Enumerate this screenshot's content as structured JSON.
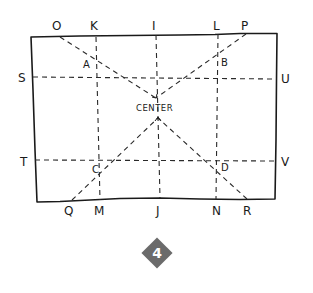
{
  "diagram": {
    "type": "hand-drawn rectangle construction with center lines and diagonals",
    "labels": {
      "top": [
        "O",
        "K",
        "I",
        "L",
        "P"
      ],
      "bottom": [
        "Q",
        "M",
        "J",
        "N",
        "R"
      ],
      "left": [
        "S",
        "T"
      ],
      "right": [
        "U",
        "V"
      ],
      "intersections": [
        "A",
        "B",
        "C",
        "D"
      ],
      "center": "CENTER"
    },
    "points": {
      "O": "O",
      "K": "K",
      "I": "I",
      "L": "L",
      "P": "P",
      "Q": "Q",
      "M": "M",
      "J": "J",
      "N": "N",
      "R": "R",
      "S": "S",
      "T": "T",
      "U": "U",
      "V": "V",
      "A": "A",
      "B": "B",
      "C": "C",
      "D": "D"
    },
    "lines": [
      {
        "from": "K",
        "to": "M",
        "style": "dashed"
      },
      {
        "from": "I",
        "to": "J",
        "style": "dashed"
      },
      {
        "from": "L",
        "to": "N",
        "style": "dashed"
      },
      {
        "from": "S",
        "to": "U",
        "style": "dashed"
      },
      {
        "from": "T",
        "to": "V",
        "style": "dashed"
      },
      {
        "from": "O",
        "to": "CENTER",
        "style": "dashed"
      },
      {
        "from": "P",
        "to": "CENTER",
        "style": "dashed"
      },
      {
        "from": "Q",
        "to": "CENTER",
        "style": "dashed"
      },
      {
        "from": "R",
        "to": "CENTER",
        "style": "dashed"
      }
    ]
  },
  "step_badge": {
    "number": "4",
    "color": "#6b6b6b"
  }
}
